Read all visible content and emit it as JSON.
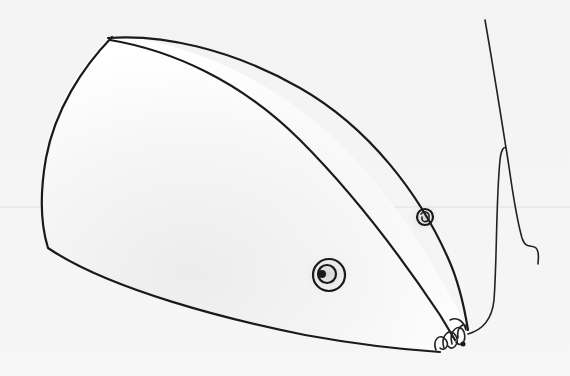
{
  "image": {
    "subject": "Pencil sketch of a cone-shaped mouse with a dangling string tail",
    "style": "hand-drawn pencil line art with soft graphite shading",
    "background_color": "#f4f4f4",
    "ink_color": "#1a1a1a"
  },
  "drawing": {
    "body": {
      "shape": "elongated cone / wedge",
      "shading": "light graphite near underside and eyes"
    },
    "eyes": [
      {
        "position": "upper ridge",
        "type": "small spiral circle"
      },
      {
        "position": "side of face",
        "type": "concentric circle with pupil"
      }
    ],
    "nose": {
      "feature": "scribbled whisker tuft at tip"
    },
    "string": {
      "feature": "thin line from nose rising upward, curling at the end"
    }
  }
}
